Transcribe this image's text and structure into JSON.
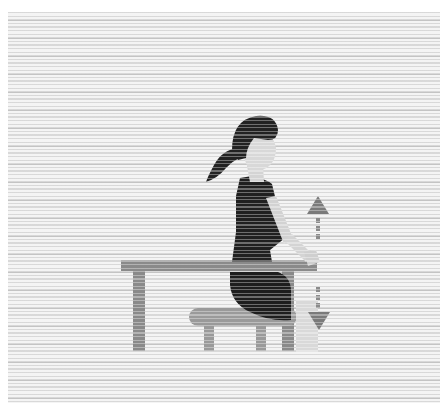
{
  "illustration": {
    "subject": "Seated wrist exercise",
    "elements": [
      "woman-figure",
      "table",
      "stool",
      "vertical-movement-arrow"
    ],
    "colors": {
      "hair_and_shirt": "#222222",
      "skin": "#d6d6d6",
      "table": "#8a8a8a",
      "stool": "#9a9a9a",
      "arrow": "#7a7a7a",
      "background_stripe": "#c4c4c4",
      "background_light": "#f4f4f4"
    }
  }
}
